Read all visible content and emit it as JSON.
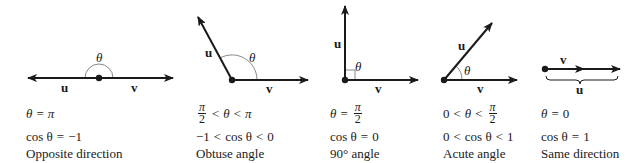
{
  "panels": [
    {
      "id": "opposite",
      "vector_labels": {
        "u": "u",
        "v": "v"
      },
      "angle_label": "θ",
      "condition": {
        "lhs": "θ",
        "op": "=",
        "rhs": "π"
      },
      "cosine": {
        "lhs": "cos θ",
        "op": "=",
        "rhs": "−1"
      },
      "caption": "Opposite direction"
    },
    {
      "id": "obtuse",
      "vector_labels": {
        "u": "u",
        "v": "v"
      },
      "angle_label": "θ",
      "condition": {
        "frac_num": "π",
        "frac_den": "2",
        "op1": "<",
        "mid": "θ",
        "op2": "<",
        "rhs": "π"
      },
      "cosine": {
        "lhs": "−1",
        "op1": "<",
        "mid": "cos θ",
        "op2": "<",
        "rhs": "0"
      },
      "caption": "Obtuse angle"
    },
    {
      "id": "right",
      "vector_labels": {
        "u": "u",
        "v": "v"
      },
      "angle_label": "θ",
      "condition": {
        "lhs": "θ",
        "op": "=",
        "frac_num": "π",
        "frac_den": "2"
      },
      "cosine": {
        "lhs": "cos θ",
        "op": "=",
        "rhs": "0"
      },
      "caption": "90° angle"
    },
    {
      "id": "acute",
      "vector_labels": {
        "u": "u",
        "v": "v"
      },
      "angle_label": "θ",
      "condition": {
        "lhs": "0",
        "op1": "<",
        "mid": "θ",
        "op2": "<",
        "frac_num": "π",
        "frac_den": "2"
      },
      "cosine": {
        "lhs": "0",
        "op1": "<",
        "mid": "cos θ",
        "op2": "<",
        "rhs": "1"
      },
      "caption": "Acute angle"
    },
    {
      "id": "same",
      "vector_labels": {
        "u": "u",
        "v": "v"
      },
      "condition": {
        "lhs": "θ",
        "op": "=",
        "rhs": "0"
      },
      "cosine": {
        "lhs": "cos θ",
        "op": "=",
        "rhs": "1"
      },
      "caption": "Same direction"
    }
  ],
  "colors": {
    "stroke": "#1a1a1a",
    "arc": "#888888"
  }
}
